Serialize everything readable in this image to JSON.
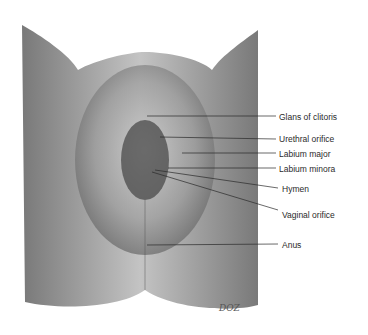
{
  "figure": {
    "background": "#ffffff",
    "shade_dark": "#3a3a3a",
    "shade_mid": "#8a8a8a",
    "shade_light": "#d8d8d8"
  },
  "labels": [
    {
      "text": "Glans of clitoris",
      "x": 279,
      "y": 112,
      "line_from": [
        147,
        116
      ],
      "line_to": [
        276,
        116
      ]
    },
    {
      "text": "Urethral orifice",
      "x": 279,
      "y": 134,
      "line_from": [
        160,
        137
      ],
      "line_to": [
        276,
        139
      ]
    },
    {
      "text": "Labium major",
      "x": 279,
      "y": 149,
      "line_from": [
        182,
        153
      ],
      "line_to": [
        276,
        153
      ]
    },
    {
      "text": "Labium minora",
      "x": 279,
      "y": 164,
      "line_from": [
        168,
        168
      ],
      "line_to": [
        276,
        168
      ]
    },
    {
      "text": "Hymen",
      "x": 282,
      "y": 184,
      "line_from": [
        155,
        170
      ],
      "line_to": [
        278,
        188
      ]
    },
    {
      "text": "Vaginal orifice",
      "x": 282,
      "y": 210,
      "line_from": [
        152,
        172
      ],
      "line_to": [
        278,
        210
      ]
    },
    {
      "text": "Anus",
      "x": 282,
      "y": 240,
      "line_from": [
        147,
        245
      ],
      "line_to": [
        278,
        244
      ]
    }
  ],
  "signature": {
    "text": "DOZ",
    "x": 219,
    "y": 303
  }
}
